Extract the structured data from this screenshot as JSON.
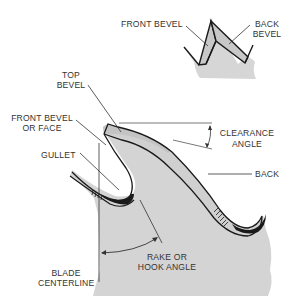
{
  "diagram": {
    "type": "saw-tooth-anatomy",
    "colors": {
      "blade_fill": "#d4d4d4",
      "outline": "#1a1a1a",
      "label_text": "#333333",
      "background": "#ffffff"
    },
    "inset": {
      "labels": {
        "front_bevel": "FRONT BEVEL",
        "back_bevel_1": "BACK",
        "back_bevel_2": "BEVEL"
      }
    },
    "main": {
      "labels": {
        "top_bevel_1": "TOP",
        "top_bevel_2": "BEVEL",
        "front_bevel_face_1": "FRONT BEVEL",
        "front_bevel_face_2": "OR FACE",
        "gullet": "GULLET",
        "clearance_angle_1": "CLEARANCE",
        "clearance_angle_2": "ANGLE",
        "back": "BACK",
        "rake_angle_1": "RAKE OR",
        "rake_angle_2": "HOOK ANGLE",
        "blade_centerline_1": "BLADE",
        "blade_centerline_2": "CENTERLINE"
      }
    }
  }
}
